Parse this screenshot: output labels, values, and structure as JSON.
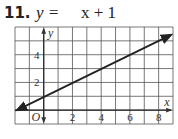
{
  "problem": {
    "number": "11.",
    "lhs": "y =",
    "rhs": "x + 1"
  },
  "chart_data": {
    "type": "line",
    "title": "11. y =   x + 1",
    "xlabel": "x",
    "ylabel": "y",
    "origin_label": "O",
    "x_ticks": [
      "2",
      "4",
      "6",
      "8"
    ],
    "y_ticks": [
      "2",
      "4"
    ],
    "xlim": [
      -2,
      9
    ],
    "ylim": [
      -1,
      6
    ],
    "grid": true,
    "series": [
      {
        "name": "y = 1/2 x + 1",
        "x": [
          -2,
          9
        ],
        "y": [
          0,
          5.5
        ],
        "arrows": "both"
      }
    ]
  }
}
